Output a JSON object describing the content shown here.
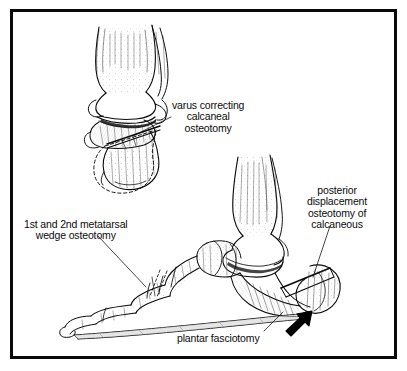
{
  "figure": {
    "kind": "medical-line-illustration",
    "background_color": "#ffffff",
    "ink_color": "#0b0b0b",
    "frame": {
      "name": "illustration-border",
      "color": "#0a0a0a",
      "thickness_px": 3
    }
  },
  "labels": {
    "varus": {
      "name": "varus-correcting-calcaneal-osteotomy",
      "lines": [
        "varus correcting",
        "calcaneal",
        "osteotomy"
      ],
      "align": "center"
    },
    "metatarsal": {
      "name": "metatarsal-wedge-osteotomy",
      "lines": [
        "1st and 2nd metatarsal",
        "wedge osteotomy"
      ],
      "align": "center"
    },
    "posterior": {
      "name": "posterior-displacement-osteotomy",
      "lines": [
        "posterior",
        "displacement",
        "osteotomy of",
        "calcaneous"
      ],
      "align": "center"
    },
    "plantar": {
      "name": "plantar-fasciotomy",
      "lines": [
        "plantar fasciotomy"
      ],
      "align": "left"
    }
  },
  "drawings": {
    "upper": {
      "name": "posterior-ankle-calcaneus-view",
      "description": "Posterior view of ankle showing tibia and fibula, talus, and calcaneus with wedge osteotomy cut and dashed outline of corrected position"
    },
    "lower": {
      "name": "lateral-foot-view",
      "description": "Lateral view of foot showing phalanges, metatarsals, midfoot, talus, tibia and fibula, calcaneus with posterior displacement osteotomy and plantar fascia strip"
    },
    "arrow": {
      "name": "displacement-arrow",
      "description": "Solid black arrow at heel indicating posterior displacement direction",
      "color": "#000000"
    }
  }
}
